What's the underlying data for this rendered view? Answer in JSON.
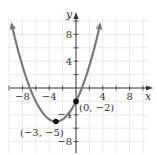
{
  "chart_data": {
    "type": "line",
    "title": "",
    "function": "y = (1/3)(x + 3)^2 - 5",
    "xlabel": "x",
    "ylabel": "y",
    "xlim": [
      -10,
      10
    ],
    "ylim": [
      -9,
      10
    ],
    "grid": true,
    "grid_step": 2,
    "x_ticks": [
      -8,
      -4,
      4,
      8
    ],
    "y_ticks": [
      8,
      4,
      -4,
      -8
    ],
    "x_tick_labels": [
      "−8",
      "−4",
      "4",
      "8"
    ],
    "y_tick_labels": [
      "8",
      "4",
      "−4",
      "−8"
    ],
    "series": [
      {
        "name": "parabola",
        "color": "#7a7a7a",
        "x": [
          -9.6,
          -9,
          -8,
          -7,
          -6,
          -5,
          -4,
          -3,
          -2,
          -1,
          0,
          1,
          2,
          3,
          3.6
        ],
        "y": [
          9.52,
          7,
          3.33,
          0.33,
          -2,
          -3.67,
          -4.67,
          -5,
          -4.67,
          -3.67,
          -2,
          0.33,
          3.33,
          7,
          9.52
        ]
      }
    ],
    "points": [
      {
        "x": -3,
        "y": -5,
        "label": "(−3, −5)"
      },
      {
        "x": 0,
        "y": -2,
        "label": "(0, −2)"
      }
    ]
  }
}
